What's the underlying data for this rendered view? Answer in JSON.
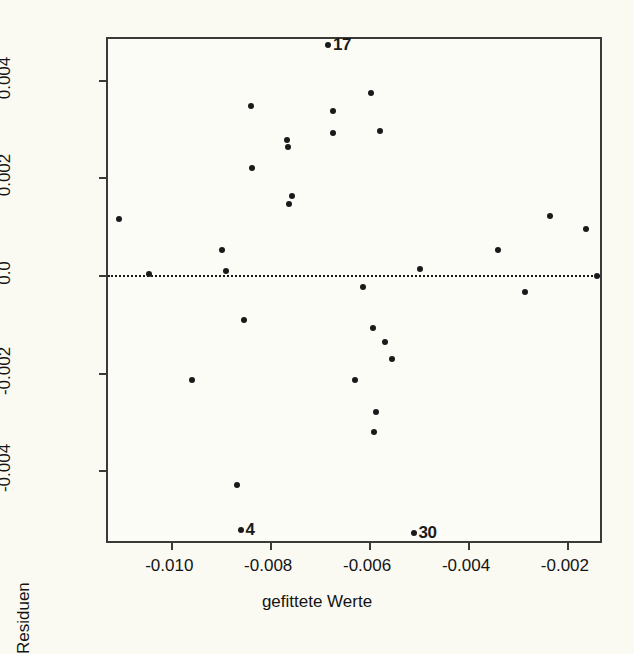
{
  "chart_data": {
    "type": "scatter",
    "title": "",
    "xlabel": "gefittete Werte",
    "ylabel": "Residuen",
    "xlim": [
      -0.01128,
      -0.00125
    ],
    "ylim": [
      -0.00553,
      0.00483
    ],
    "xticks": [
      -0.01,
      -0.008,
      -0.006,
      -0.004,
      -0.002
    ],
    "xticklabels": [
      "-0.010",
      "-0.008",
      "-0.006",
      "-0.004",
      "-0.002"
    ],
    "yticks": [
      0.004,
      0.002,
      0.0,
      -0.002,
      -0.004
    ],
    "yticklabels": [
      "0.004",
      "0.002",
      "0.0",
      "-0.002",
      "-0.004"
    ],
    "grid": false,
    "legend": null,
    "reference_lines": [
      {
        "axis": "y",
        "value": 0.0,
        "style": "dotted",
        "color": "#1a1a1a"
      }
    ],
    "marker": {
      "shape": "circle",
      "filled": true,
      "color": "#1a1a1a",
      "size": 6
    },
    "points": [
      {
        "x": -0.01106,
        "y": 0.00114
      },
      {
        "x": -0.01046,
        "y": 2e-05
      },
      {
        "x": -0.00959,
        "y": -0.00215
      },
      {
        "x": -0.00897,
        "y": 0.0005
      },
      {
        "x": -0.00889,
        "y": 8e-05
      },
      {
        "x": -0.00868,
        "y": -0.0043
      },
      {
        "x": -0.0086,
        "y": -0.00523
      },
      {
        "x": -0.00853,
        "y": -0.00092
      },
      {
        "x": -0.00838,
        "y": 0.00345
      },
      {
        "x": -0.00836,
        "y": 0.00218
      },
      {
        "x": -0.00766,
        "y": 0.00276
      },
      {
        "x": -0.00764,
        "y": 0.00262
      },
      {
        "x": -0.00755,
        "y": 0.00161
      },
      {
        "x": -0.00762,
        "y": 0.00146
      },
      {
        "x": -0.00683,
        "y": 0.0047
      },
      {
        "x": -0.00672,
        "y": 0.00336
      },
      {
        "x": -0.00674,
        "y": 0.0029
      },
      {
        "x": -0.00628,
        "y": -0.00216
      },
      {
        "x": -0.00613,
        "y": -0.00025
      },
      {
        "x": -0.00596,
        "y": 0.00373
      },
      {
        "x": -0.00592,
        "y": -0.00108
      },
      {
        "x": -0.00586,
        "y": -0.0028
      },
      {
        "x": -0.0059,
        "y": -0.00322
      },
      {
        "x": -0.00578,
        "y": 0.00294
      },
      {
        "x": -0.00568,
        "y": -0.00137
      },
      {
        "x": -0.00553,
        "y": -0.00172
      },
      {
        "x": -0.0051,
        "y": -0.00528
      },
      {
        "x": -0.00497,
        "y": 0.00012
      },
      {
        "x": -0.0034,
        "y": 0.00051
      },
      {
        "x": -0.00285,
        "y": -0.00035
      },
      {
        "x": -0.00234,
        "y": 0.0012
      },
      {
        "x": -0.00162,
        "y": 0.00095
      },
      {
        "x": -0.0014,
        "y": -3e-05
      }
    ],
    "annotations": [
      {
        "label": "17",
        "x": -0.00683,
        "y": 0.0047
      },
      {
        "label": "4",
        "x": -0.0086,
        "y": -0.00523
      },
      {
        "label": "30",
        "x": -0.0051,
        "y": -0.00528
      }
    ]
  },
  "figure": {
    "background_color": "#fbfaf2",
    "axis_color": "#3a3a38",
    "point_color": "#1a1a1a"
  }
}
